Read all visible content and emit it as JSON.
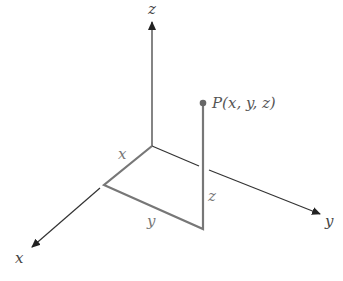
{
  "diagram": {
    "type": "3d-coordinate-system",
    "axes": {
      "x": {
        "label": "x"
      },
      "y": {
        "label": "y"
      },
      "z": {
        "label": "z"
      }
    },
    "point": {
      "label": "P(x, y, z)"
    },
    "components": {
      "x": "x",
      "y": "y",
      "z": "z"
    },
    "colors": {
      "axis": "#333333",
      "projection": "#777777",
      "point": "#666666"
    }
  }
}
